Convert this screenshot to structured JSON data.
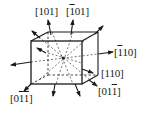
{
  "diagram": {
    "title": "",
    "labels": [
      {
        "id": "l101",
        "text": "[101]",
        "parts": [
          {
            "t": "[",
            "b": false
          },
          {
            "t": "1",
            "b": false
          },
          {
            "t": "0",
            "b": false
          },
          {
            "t": "1",
            "b": false
          },
          {
            "t": "]",
            "b": false
          }
        ]
      },
      {
        "id": "lm101",
        "text": "[-101]",
        "parts": [
          {
            "t": "[",
            "b": false
          },
          {
            "t": "1",
            "b": true
          },
          {
            "t": "0",
            "b": false
          },
          {
            "t": "1",
            "b": false
          },
          {
            "t": "]",
            "b": false
          }
        ]
      },
      {
        "id": "lm110",
        "text": "[-110]",
        "parts": [
          {
            "t": "[",
            "b": false
          },
          {
            "t": "1",
            "b": true
          },
          {
            "t": "1",
            "b": false
          },
          {
            "t": "0",
            "b": false
          },
          {
            "t": "]",
            "b": false
          }
        ]
      },
      {
        "id": "l110",
        "text": "[110]",
        "parts": [
          {
            "t": "[",
            "b": false
          },
          {
            "t": "1",
            "b": false
          },
          {
            "t": "1",
            "b": false
          },
          {
            "t": "0",
            "b": false
          },
          {
            "t": "]",
            "b": false
          }
        ]
      },
      {
        "id": "l01m1",
        "text": "[01-1]",
        "parts": [
          {
            "t": "[",
            "b": false
          },
          {
            "t": "0",
            "b": false
          },
          {
            "t": "1",
            "b": false
          },
          {
            "t": "1",
            "b": true
          },
          {
            "t": "]",
            "b": false
          }
        ]
      },
      {
        "id": "l0m1m1",
        "text": "[0-1-1]",
        "parts": [
          {
            "t": "[",
            "b": false
          },
          {
            "t": "0",
            "b": false
          },
          {
            "t": "1",
            "b": true
          },
          {
            "t": "1",
            "b": true
          },
          {
            "t": "]",
            "b": false
          }
        ]
      }
    ],
    "colors": {
      "line": "#1a1a1a",
      "background": "#ffffff"
    }
  }
}
